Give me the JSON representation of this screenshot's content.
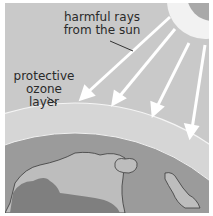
{
  "diagram": {
    "labels": {
      "rays_line1": "harmful rays",
      "rays_line2": "from the sun",
      "ozone_line1": "protective",
      "ozone_line2": "ozone layer"
    },
    "elements": [
      "sun",
      "harmful-rays",
      "ozone-layer",
      "earth"
    ],
    "colors": {
      "sky": "#c9c9c9",
      "sun_outer": "#f2f2f2",
      "sun_inner": "#a9a9a9",
      "ozone": "#dadada",
      "ocean": "#9a9a9a",
      "land": "#bdbdbd",
      "dark_land": "#7f7f7f",
      "ray": "#ffffff"
    }
  }
}
